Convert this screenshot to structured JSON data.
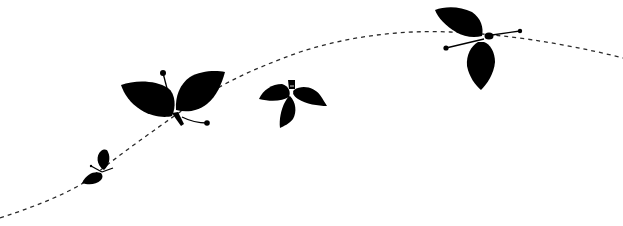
{
  "illustration": {
    "title": "Butterflies along a dashed flight path",
    "colors": {
      "background": "#ffffff",
      "silhouette": "#000000",
      "path": "#2a2a2a"
    },
    "elements": {
      "flight_path": {
        "style": "dashed"
      },
      "butterflies": [
        {
          "name": "small-butterfly",
          "size": "small"
        },
        {
          "name": "large-butterfly",
          "size": "large"
        },
        {
          "name": "medium-butterfly",
          "size": "medium"
        },
        {
          "name": "upper-right-butterfly",
          "size": "large"
        }
      ]
    }
  }
}
